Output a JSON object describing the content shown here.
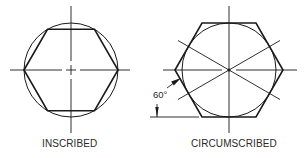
{
  "figures": [
    {
      "id": "inscribed",
      "caption": "INSCRIBED",
      "center": [
        71,
        70
      ],
      "circle_radius": 47,
      "hexagon_orientation": "pointy-left-right",
      "hexagon_vertex_radius": 47
    },
    {
      "id": "circumscribed",
      "caption": "CIRCUMSCRIBED",
      "center": [
        229,
        70
      ],
      "circle_radius": 47,
      "hexagon_orientation": "pointy-left-right",
      "hexagon_vertex_radius": 54,
      "construction_lines_angle_deg": 30,
      "angle_annotation": "60°"
    }
  ],
  "colors": {
    "stroke": "#1a1a1a",
    "text": "#2a2a2a",
    "background": "#ffffff"
  }
}
